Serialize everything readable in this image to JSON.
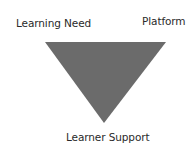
{
  "diagram": {
    "type": "inverted-triangle",
    "shape_color": "#6b6b6b",
    "labels": {
      "top_left": "Learning Need",
      "top_right": "Platform",
      "bottom": "Learner Support"
    }
  }
}
